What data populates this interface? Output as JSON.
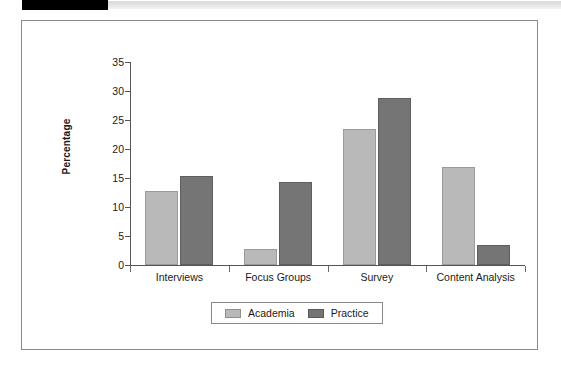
{
  "header": {
    "tab_label": "",
    "rule_label": ""
  },
  "chart_data": {
    "type": "bar",
    "title": "",
    "xlabel": "",
    "ylabel": "Percentage",
    "categories": [
      "Interviews",
      "Focus Groups",
      "Survey",
      "Content Analysis"
    ],
    "series": [
      {
        "name": "Academia",
        "color": "#b9b9b9",
        "values": [
          12.7,
          2.8,
          23.4,
          16.9
        ]
      },
      {
        "name": "Practice",
        "color": "#757575",
        "values": [
          15.4,
          14.3,
          28.8,
          3.4
        ]
      }
    ],
    "ylim": [
      0,
      35
    ],
    "yticks": [
      0,
      5,
      10,
      15,
      20,
      25,
      30,
      35
    ],
    "ytick_labels": [
      "0",
      "5",
      "10",
      "15",
      "20",
      "25",
      "30",
      "35"
    ],
    "grid": false,
    "legend_position": "bottom-center"
  },
  "legend": {
    "items": [
      {
        "label": "Academia",
        "swatch": "academia"
      },
      {
        "label": "Practice",
        "swatch": "practice"
      }
    ]
  }
}
